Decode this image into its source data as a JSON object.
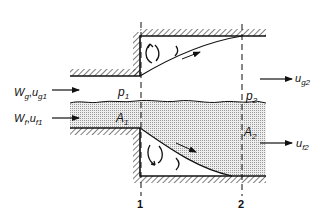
{
  "diagram": {
    "type": "two-phase flow through sudden expansion",
    "inlet_gas": {
      "mass_flow": "W",
      "mass_flow_sub": "g",
      "velocity": "u",
      "velocity_sub": "g1"
    },
    "inlet_liquid": {
      "mass_flow": "W",
      "mass_flow_sub": "f",
      "velocity": "u",
      "velocity_sub": "f1"
    },
    "outlet_gas": {
      "velocity": "u",
      "velocity_sub": "g2"
    },
    "outlet_liquid": {
      "velocity": "u",
      "velocity_sub": "f2"
    },
    "pressure_1": {
      "symbol": "p",
      "sub": "1"
    },
    "pressure_2": {
      "symbol": "p",
      "sub": "2"
    },
    "area_1": {
      "symbol": "A",
      "sub": "1"
    },
    "area_2": {
      "symbol": "A",
      "sub": "2"
    },
    "section_1": "1",
    "section_2": "2",
    "separator": ","
  },
  "colors": {
    "line": "#111111",
    "liquid_fill": "#d9d9d9",
    "background": "#ffffff"
  }
}
